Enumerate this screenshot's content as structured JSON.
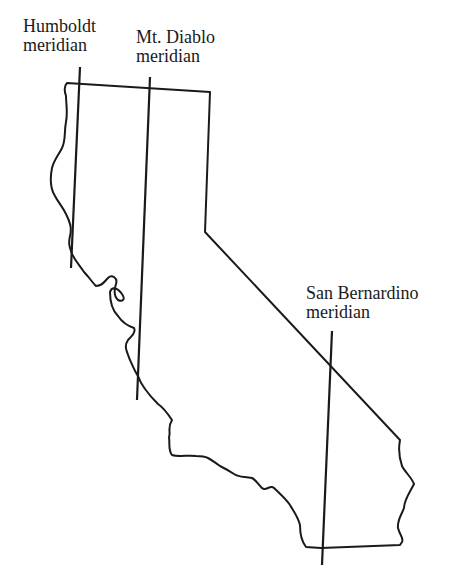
{
  "figure": {
    "outline_color": "#1a1a1a",
    "background_color": "#ffffff"
  },
  "meridians": [
    {
      "id": "humboldt",
      "name": "Humboldt",
      "suffix": "meridian"
    },
    {
      "id": "mt-diablo",
      "name": "Mt. Diablo",
      "suffix": "meridian"
    },
    {
      "id": "san-bernardino",
      "name": "San Bernardino",
      "suffix": "meridian"
    }
  ]
}
